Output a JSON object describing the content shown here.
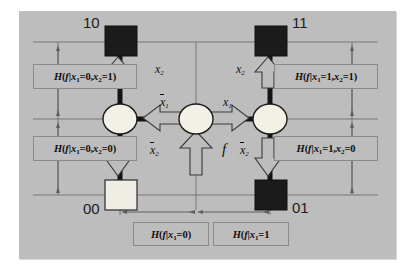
{
  "figure": {
    "background_color": "#ffffff",
    "panel_color": "#bdbdbd",
    "ink_color": "#1a1a1a"
  },
  "nodes": [
    {
      "id": "10",
      "code": "10",
      "shape": "square",
      "fill": "dark",
      "x": 120,
      "y": 42
    },
    {
      "id": "11",
      "code": "11",
      "shape": "square",
      "fill": "dark",
      "x": 270,
      "y": 42
    },
    {
      "id": "00",
      "code": "00",
      "shape": "square",
      "fill": "light",
      "x": 120,
      "y": 195
    },
    {
      "id": "01",
      "code": "01",
      "shape": "square",
      "fill": "dark",
      "x": 270,
      "y": 195
    },
    {
      "id": "left",
      "code": "",
      "shape": "circle",
      "fill": "light",
      "x": 120,
      "y": 119
    },
    {
      "id": "center",
      "code": "",
      "shape": "circle",
      "fill": "light",
      "x": 196,
      "y": 119
    },
    {
      "id": "right",
      "code": "",
      "shape": "circle",
      "fill": "light",
      "x": 270,
      "y": 119
    }
  ],
  "edge_labels": {
    "top_left_x2": "x",
    "top_left_x2_sub": "2",
    "top_right_x2": "x",
    "top_right_x2_sub": "2",
    "center_left_nx1": "x",
    "center_left_nx1_sub": "1",
    "center_right_x1": "x",
    "center_right_x1_sub": "1",
    "bottom_left_nx2": "x",
    "bottom_left_nx2_sub": "2",
    "bottom_right_nx2": "x",
    "bottom_right_nx2_sub": "2",
    "function_input": "f"
  },
  "annotations": {
    "top_left": {
      "fn": "H(f",
      "bar": "|",
      "cond": "x",
      "sub1": "1",
      "eq1": "=0,",
      "v2": "x",
      "sub2": "2",
      "eq2": "=1)"
    },
    "bottom_left": {
      "fn": "H(f",
      "bar": "|",
      "cond": "x",
      "sub1": "1",
      "eq1": "=0,",
      "v2": "x",
      "sub2": "2",
      "eq2": "=0)"
    },
    "top_right": {
      "fn": "H(f",
      "bar": "|",
      "cond": "x",
      "sub1": "1",
      "eq1": "=1,",
      "v2": "x",
      "sub2": "2",
      "eq2": "=1)"
    },
    "bottom_right": {
      "fn": "H(f",
      "bar": "|",
      "cond": "x",
      "sub1": "1",
      "eq1": "=1,",
      "v2": "x",
      "sub2": "2",
      "eq2": "=0"
    },
    "bottom_center_left": {
      "fn": "H(f",
      "bar": "|",
      "cond": "x",
      "sub1": "1",
      "eq1": "=0)"
    },
    "bottom_center_right": {
      "fn": "H(f",
      "bar": "|",
      "cond": "x",
      "sub1": "1",
      "eq1": "=1"
    }
  },
  "corner_codes": {
    "top_left": "10",
    "top_right": "11",
    "bottom_left": "00",
    "bottom_right": "01"
  }
}
